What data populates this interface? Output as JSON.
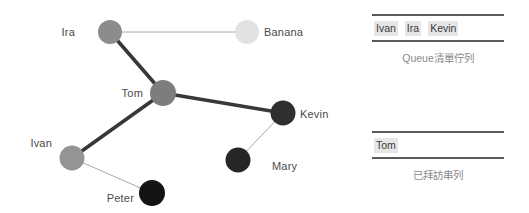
{
  "graph": {
    "nodes": [
      {
        "id": "ira",
        "label": "Ira",
        "cx": 110,
        "cy": 32,
        "r": 12,
        "color": "#8c8c8c",
        "label_x": 75,
        "label_y": 26,
        "label_align": "right"
      },
      {
        "id": "banana",
        "label": "Banana",
        "cx": 247,
        "cy": 32,
        "r": 12,
        "color": "#e2e2e2",
        "label_x": 264,
        "label_y": 26,
        "label_align": "left"
      },
      {
        "id": "tom",
        "label": "Tom",
        "cx": 163,
        "cy": 93,
        "r": 13,
        "color": "#7d7d7d",
        "label_x": 143,
        "label_y": 87,
        "label_align": "right"
      },
      {
        "id": "kevin",
        "label": "Kevin",
        "cx": 283,
        "cy": 113,
        "r": 12.5,
        "color": "#2f2f2f",
        "label_x": 300,
        "label_y": 108,
        "label_align": "left"
      },
      {
        "id": "ivan",
        "label": "Ivan",
        "cx": 72,
        "cy": 158,
        "r": 12.5,
        "color": "#949494",
        "label_x": 52,
        "label_y": 137,
        "label_align": "right"
      },
      {
        "id": "mary",
        "label": "Mary",
        "cx": 238,
        "cy": 160,
        "r": 12.5,
        "color": "#262626",
        "label_x": 272,
        "label_y": 160,
        "label_align": "left"
      },
      {
        "id": "peter",
        "label": "Peter",
        "cx": 152,
        "cy": 193,
        "r": 13,
        "color": "#141414",
        "label_x": 134,
        "label_y": 192,
        "label_align": "right"
      }
    ],
    "edges": [
      {
        "from": "ira",
        "to": "banana",
        "weight": "thin",
        "width": 1,
        "color": "#a8a8a8"
      },
      {
        "from": "ira",
        "to": "tom",
        "weight": "thick",
        "width": 3.6,
        "color": "#383838"
      },
      {
        "from": "tom",
        "to": "kevin",
        "weight": "thick",
        "width": 3.6,
        "color": "#383838"
      },
      {
        "from": "tom",
        "to": "ivan",
        "weight": "thick",
        "width": 3.6,
        "color": "#383838"
      },
      {
        "from": "ivan",
        "to": "peter",
        "weight": "thin",
        "width": 1,
        "color": "#a8a8a8"
      },
      {
        "from": "kevin",
        "to": "mary",
        "weight": "thin",
        "width": 1,
        "color": "#a8a8a8"
      }
    ]
  },
  "side_panel": {
    "queue": {
      "items": [
        "Ivan",
        "Ira",
        "Kevin"
      ],
      "caption": "Queue清單佇列"
    },
    "visited": {
      "items": [
        "Tom"
      ],
      "caption": "已拜訪串列"
    }
  },
  "colors": {
    "rule": "#5a5a5a",
    "token_bg": "#e6e6e6",
    "text": "#3f3f3f",
    "caption": "#6b6b6b"
  }
}
